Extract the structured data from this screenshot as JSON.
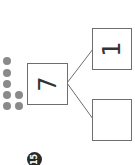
{
  "worksheet": {
    "problem_number": "15",
    "number_bond": {
      "whole": "7",
      "part_top": "1",
      "part_bottom": ""
    },
    "counter_dots": {
      "count": 7,
      "color": "#8a8a8a"
    },
    "orientation": "rotated 90 degrees counter-clockwise"
  }
}
